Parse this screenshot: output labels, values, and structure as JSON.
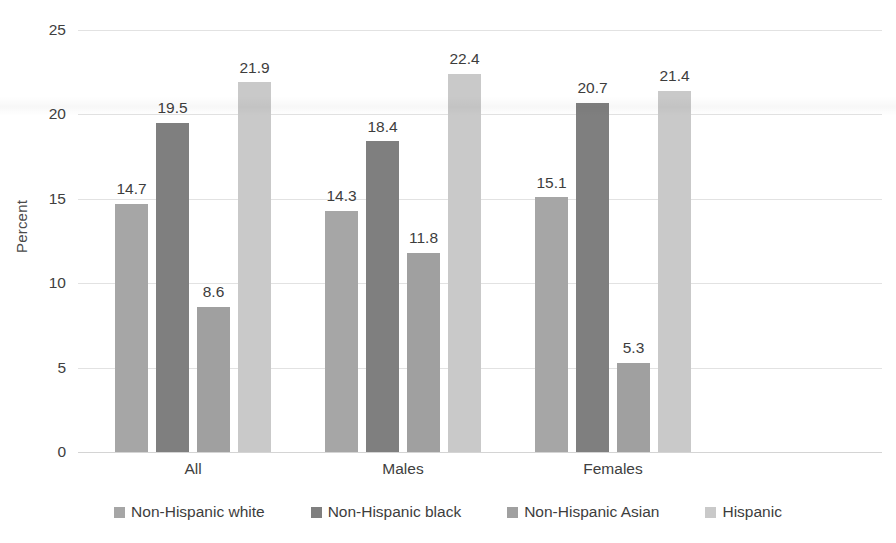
{
  "chart_data": {
    "type": "bar",
    "title": "",
    "xlabel": "",
    "ylabel": "Percent",
    "categories": [
      "All",
      "Males",
      "Females"
    ],
    "series": [
      {
        "name": "Non-Hispanic white",
        "color": "#a6a6a6",
        "values": [
          14.7,
          14.3,
          15.1
        ]
      },
      {
        "name": "Non-Hispanic black",
        "color": "#7f7f7f",
        "values": [
          19.5,
          18.4,
          20.7
        ]
      },
      {
        "name": "Non-Hispanic Asian",
        "color": "#a0a0a0",
        "values": [
          8.6,
          11.8,
          5.3
        ]
      },
      {
        "name": "Hispanic",
        "color": "#c9c9c9",
        "values": [
          21.9,
          22.4,
          21.4
        ]
      }
    ],
    "ylim": [
      0,
      25
    ],
    "yticks": [
      0,
      5,
      10,
      15,
      20,
      25
    ],
    "ytick_labels": [
      "0",
      "5",
      "10",
      "15",
      "20",
      "25"
    ],
    "data_labels": {
      "All": [
        "14.7",
        "19.5",
        "8.6",
        "21.9"
      ],
      "Males": [
        "14.3",
        "18.4",
        "11.8",
        "22.4"
      ],
      "Females": [
        "15.1",
        "20.7",
        "5.3",
        "21.4"
      ]
    },
    "grid": true,
    "legend_position": "bottom"
  },
  "axis": {
    "y_title": "Percent"
  }
}
